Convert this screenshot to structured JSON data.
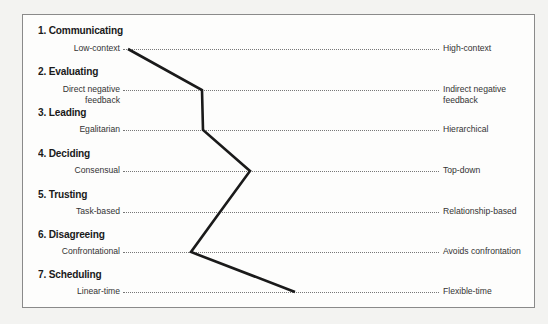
{
  "dimensions": [
    {
      "number": "1.",
      "title": "1. Communicating",
      "left": "Low-context",
      "right": "High-context",
      "position": 0.02
    },
    {
      "number": "2.",
      "title": "2. Evaluating",
      "left": "Direct negative feedback",
      "left_lines": [
        "Direct negative",
        "feedback"
      ],
      "right": "Indirect negative feedback",
      "right_lines": [
        "Indirect negative",
        "feedback"
      ],
      "position": 0.25
    },
    {
      "number": "3.",
      "title": "3. Leading",
      "left": "Egalitarian",
      "right": "Hierarchical",
      "position": 0.25
    },
    {
      "number": "4.",
      "title": "4. Deciding",
      "left": "Consensual",
      "right": "Top-down",
      "position": 0.4
    },
    {
      "number": "5.",
      "title": "5. Trusting",
      "left": "Task-based",
      "right": "Relationship-based",
      "position": 0.3
    },
    {
      "number": "6.",
      "title": "6. Disagreeing",
      "left": "Confrontational",
      "right": "Avoids confrontation",
      "position": 0.21
    },
    {
      "number": "7.",
      "title": "7. Scheduling",
      "left": "Linear-time",
      "right": "Flexible-time",
      "position": 0.54
    }
  ],
  "profile_line": {
    "color": "#1a1a1a",
    "points": [
      [
        128,
        49
      ],
      [
        202,
        90
      ],
      [
        203,
        130
      ],
      [
        250,
        171
      ],
      [
        220,
        212
      ],
      [
        191,
        252
      ],
      [
        295,
        292
      ]
    ]
  }
}
